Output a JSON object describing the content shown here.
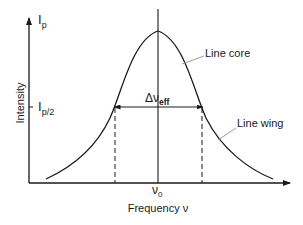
{
  "diagram": {
    "axes": {
      "y_label": "Intensity",
      "x_label": "Frequency ν",
      "y_ticks": [
        {
          "main": "I",
          "sub": "p"
        },
        {
          "main": "I",
          "sub": "p/2"
        }
      ],
      "x_ticks": [
        {
          "main": "ν",
          "sub": "0"
        }
      ]
    },
    "annotations": {
      "width": {
        "main": "Δν",
        "sub": "eff"
      },
      "core_label": "Line core",
      "wing_label": "Line wing"
    },
    "colors": {
      "line": "#1a1a1a",
      "leader": "#9a9a9a",
      "background": "#ffffff"
    }
  }
}
